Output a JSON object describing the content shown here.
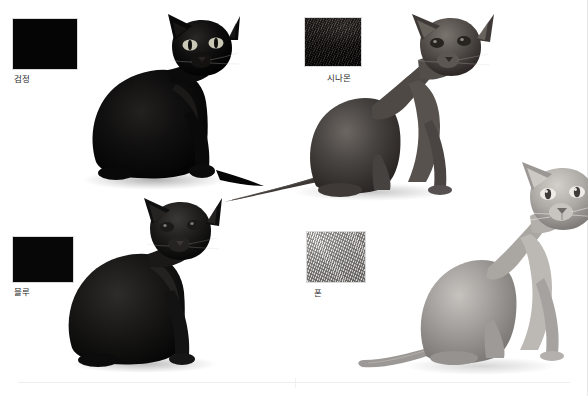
{
  "page": {
    "background_color": "#ffffff",
    "width": 588,
    "height": 396
  },
  "entries": [
    {
      "id": "black",
      "label": "검정",
      "swatch_kind": "solid",
      "swatch_color": "#050505",
      "cat_tone": "#0a0a0a",
      "cat_pose": "sitting-facing-right",
      "quadrant": "top-left"
    },
    {
      "id": "cinnamon",
      "label": "시나몬",
      "swatch_kind": "fur-texture",
      "swatch_color": "#1d1a18",
      "cat_tone": "#4a4643",
      "cat_pose": "sitting-long-tail",
      "quadrant": "top-right"
    },
    {
      "id": "blue",
      "label": "블루",
      "swatch_kind": "solid",
      "swatch_color": "#070707",
      "cat_tone": "#151413",
      "cat_pose": "sitting-upright",
      "quadrant": "bottom-left"
    },
    {
      "id": "fawn",
      "label": "폰",
      "swatch_kind": "fur-texture",
      "swatch_color": "#b7b4b0",
      "cat_tone": "#9a9693",
      "cat_pose": "sitting-tall",
      "quadrant": "bottom-right"
    }
  ],
  "footer": {
    "rule_color": "#ededed"
  }
}
